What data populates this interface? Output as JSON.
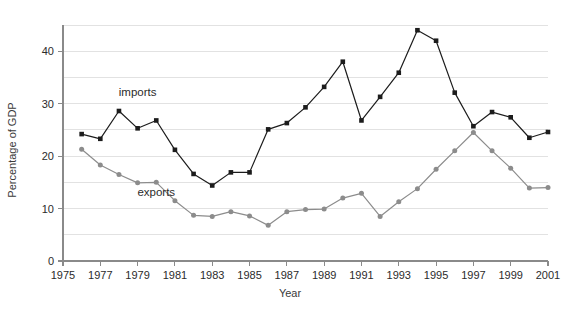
{
  "chart_data": {
    "type": "line",
    "title": "",
    "xlabel": "Year",
    "ylabel": "Percentage of GDP",
    "xlim": [
      1975,
      2001
    ],
    "ylim": [
      0,
      45
    ],
    "yticks": [
      0,
      10,
      20,
      30,
      40
    ],
    "ytick_labels": [
      "0",
      "10",
      "20",
      "30",
      "40"
    ],
    "gridlines_y": [
      5,
      10,
      15,
      20,
      25,
      30,
      35,
      40,
      45
    ],
    "grid": true,
    "xticks": [
      1975,
      1977,
      1979,
      1981,
      1983,
      1985,
      1987,
      1989,
      1991,
      1993,
      1995,
      1997,
      1999,
      2001
    ],
    "xtick_labels": [
      "1975",
      "1977",
      "1979",
      "1981",
      "1983",
      "1985",
      "1987",
      "1989",
      "1991",
      "1993",
      "1995",
      "1997",
      "1999",
      "2001"
    ],
    "legend_position": "inline-annotation",
    "x": [
      1976,
      1977,
      1978,
      1979,
      1980,
      1981,
      1982,
      1983,
      1984,
      1985,
      1986,
      1987,
      1988,
      1989,
      1990,
      1991,
      1992,
      1993,
      1994,
      1995,
      1996,
      1997,
      1998,
      1999,
      2000,
      2001
    ],
    "series": [
      {
        "name": "imports",
        "color": "#1c1c1c",
        "marker": "square",
        "values": [
          24.2,
          23.3,
          28.6,
          25.3,
          26.8,
          21.2,
          16.6,
          14.4,
          16.9,
          16.9,
          25.1,
          26.3,
          29.3,
          33.2,
          38.0,
          26.8,
          31.3,
          35.9,
          44.0,
          42.0,
          32.1,
          25.7,
          28.4,
          27.4,
          23.5,
          24.6
        ]
      },
      {
        "name": "exports",
        "color": "#8c8c8c",
        "marker": "circle",
        "values": [
          21.3,
          18.3,
          16.5,
          14.9,
          15.0,
          11.5,
          8.7,
          8.5,
          9.4,
          8.6,
          6.8,
          9.4,
          9.8,
          9.9,
          12.0,
          12.9,
          8.5,
          11.3,
          13.8,
          17.5,
          21.0,
          24.5,
          21.0,
          17.7,
          13.9,
          14.0
        ]
      }
    ],
    "annotations": [
      {
        "text": "imports",
        "x": 1979.0,
        "y": 31.5
      },
      {
        "text": "exports",
        "x": 1980.0,
        "y": 12.4
      }
    ]
  }
}
